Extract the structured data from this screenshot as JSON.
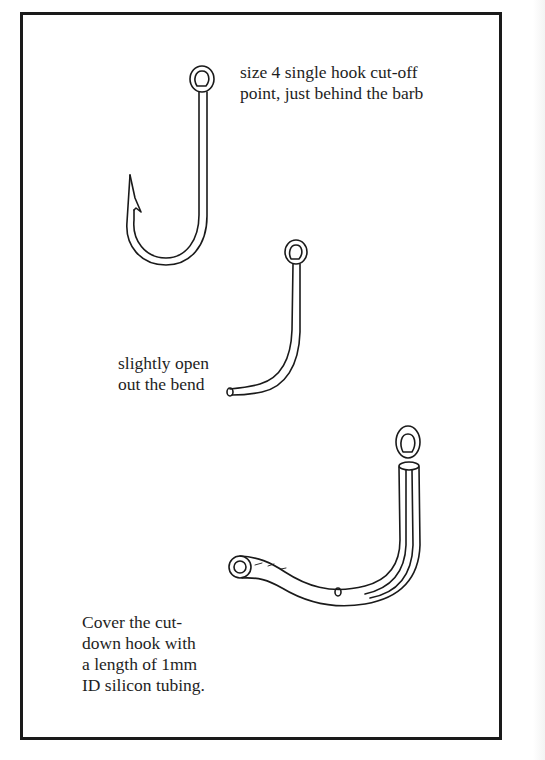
{
  "figure": {
    "type": "instructional-line-drawing",
    "ink_color": "#1a1a1a",
    "background_color": "#ffffff"
  },
  "labels": {
    "step1": "size 4 single hook cut-off\npoint, just behind the barb",
    "step2": "slightly open\nout the bend",
    "step3": "Cover the cut-\ndown hook with\na length of 1mm\nID silicon tubing."
  },
  "drawings": [
    {
      "name": "hook-original",
      "description": "size 4 single hook with eye and barb"
    },
    {
      "name": "hook-cut-down",
      "description": "hook cut behind barb with bend slightly opened"
    },
    {
      "name": "hook-with-tubing",
      "description": "cut-down hook covered in silicon tubing"
    }
  ]
}
